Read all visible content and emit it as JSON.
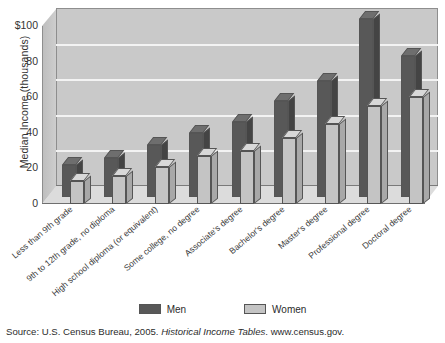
{
  "chart_data": {
    "type": "bar",
    "title": "",
    "xlabel": "",
    "ylabel": "Median Income (thousands)",
    "ylim": [
      0,
      100
    ],
    "yticks": [
      "$100",
      "80",
      "60",
      "40",
      "20",
      "0"
    ],
    "ytick_values": [
      100,
      80,
      60,
      40,
      20,
      0
    ],
    "grid": true,
    "legend_position": "bottom",
    "categories": [
      "Less than 9th grade",
      "9th to 12th grade, no diploma",
      "High school diploma (or equivalent)",
      "Some college, no degree",
      "Associate's degree",
      "Bachelor's degree",
      "Master's degree",
      "Professional degree",
      "Doctoral degree"
    ],
    "series": [
      {
        "name": "Men",
        "color": "#585858",
        "values": [
          18,
          22,
          29,
          36,
          42,
          54,
          65,
          100,
          79
        ]
      },
      {
        "name": "Women",
        "color": "#c4c4c4",
        "values": [
          13,
          16,
          21,
          27,
          30,
          37,
          45,
          55,
          60
        ]
      }
    ]
  },
  "legend": {
    "items": [
      {
        "label": "Men",
        "color": "#585858"
      },
      {
        "label": "Women",
        "color": "#c4c4c4"
      }
    ]
  },
  "source": {
    "prefix": "Source: U.S. Census Bureau, 2005. ",
    "italic": "Historical Income Tables",
    "suffix": ". www.census.gov."
  }
}
